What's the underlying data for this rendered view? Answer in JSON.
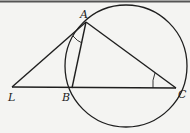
{
  "diagram": {
    "type": "geometry",
    "points": {
      "A": {
        "label": "A",
        "x": 86,
        "y": 22
      },
      "L": {
        "label": "L",
        "x": 12,
        "y": 87
      },
      "B": {
        "label": "B",
        "x": 72,
        "y": 88
      },
      "C": {
        "label": "C",
        "x": 176,
        "y": 88
      }
    },
    "circle": {
      "cx": 126,
      "cy": 66,
      "r": 61
    },
    "segments": [
      "LA",
      "AB",
      "AC",
      "LC"
    ],
    "angle_marks": [
      "angle LAB",
      "angle ACB"
    ],
    "colors": {
      "stroke": "#1e1e1e",
      "background": "#f4f4f2"
    }
  }
}
